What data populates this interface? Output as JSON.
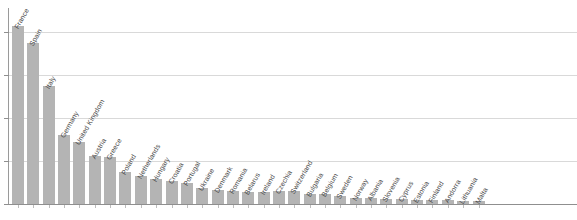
{
  "chart_data": {
    "type": "bar",
    "title": "",
    "subtitle": "",
    "xlabel": "",
    "ylabel": "",
    "legend": null,
    "grid": true,
    "gridline_count": 4,
    "ylim": [
      0,
      100
    ],
    "yticks": [
      0,
      20,
      40,
      60,
      80,
      100
    ],
    "ytick_labels": [
      "",
      "",
      "",
      "",
      "",
      ""
    ],
    "orientation": "vertical",
    "sorted": "descending",
    "bar_color": "#b4b4b4",
    "gridline_color": "#d9d9d9",
    "axis_color": "#8f8f8f",
    "label_rotation_deg": -60,
    "categories": [
      "France",
      "Spain",
      "Italy",
      "Germany",
      "United Kingdom",
      "Austria",
      "Greece",
      "Poland",
      "Netherlands",
      "Hungary",
      "Croatia",
      "Portugal",
      "Ukraine",
      "Denmark",
      "Romania",
      "Belarus",
      "Ireland",
      "Czechia",
      "Switzerland",
      "Bulgaria",
      "Belgium",
      "Sweden",
      "Norway",
      "Albania",
      "Slovenia",
      "Cyprus",
      "Estonia",
      "Finland",
      "Andorra",
      "Lithuania",
      "Malta"
    ],
    "values": [
      83.0,
      75.0,
      55.0,
      32.0,
      29.0,
      22.5,
      22.0,
      15.0,
      13.0,
      11.5,
      10.5,
      10.0,
      7.5,
      6.5,
      6.0,
      5.8,
      5.8,
      6.0,
      6.0,
      4.8,
      4.8,
      3.8,
      2.8,
      2.8,
      2.4,
      2.4,
      1.9,
      1.9,
      1.9,
      1.5,
      1.5
    ]
  }
}
